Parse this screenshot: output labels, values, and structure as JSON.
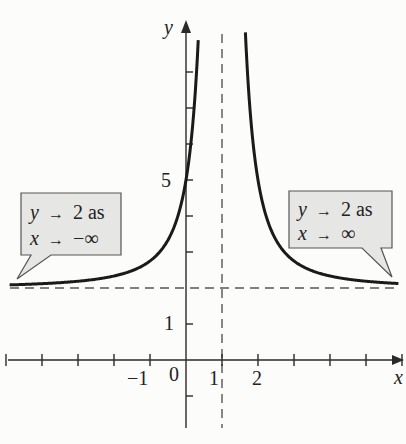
{
  "chart_data": {
    "type": "line",
    "title": "",
    "xlabel": "x",
    "ylabel": "y",
    "function": "y = 2 + 3/(x - 1)^2",
    "x_ticks": [
      -5,
      -4,
      -3,
      -2,
      -1,
      0,
      1,
      2,
      3,
      4,
      5,
      6
    ],
    "x_tick_labels": [
      {
        "value": -1,
        "label": "−1"
      },
      {
        "value": 0,
        "label": "0"
      },
      {
        "value": 1,
        "label": "1"
      },
      {
        "value": 2,
        "label": "2"
      }
    ],
    "y_ticks": [
      -1,
      1,
      2,
      3,
      4,
      5,
      6,
      7,
      8
    ],
    "y_tick_labels": [
      {
        "value": 1,
        "label": "1"
      },
      {
        "value": 5,
        "label": "5"
      }
    ],
    "xlim": [
      -5.1,
      6.1
    ],
    "ylim": [
      -1.9,
      9.3
    ],
    "grid": false,
    "asymptotes": {
      "vertical": {
        "x": 1,
        "style": "dashed"
      },
      "horizontal": {
        "y": 2,
        "style": "dashed"
      }
    },
    "series": [
      {
        "name": "left branch",
        "x": [
          -4.8,
          -4,
          -3,
          -2,
          -1,
          -0.5,
          0,
          0.2,
          0.33
        ],
        "y": [
          2.09,
          2.12,
          2.19,
          2.33,
          2.75,
          3.33,
          5.0,
          6.69,
          8.68
        ]
      },
      {
        "name": "right branch",
        "x": [
          1.64,
          1.8,
          2,
          2.5,
          3,
          4,
          5,
          5.9
        ],
        "y": [
          9.32,
          6.69,
          5.0,
          3.33,
          2.75,
          2.33,
          2.19,
          2.12
        ]
      }
    ],
    "annotations": [
      {
        "line1": "y → 2 as",
        "line2": "x → −∞",
        "points_to": "left tail"
      },
      {
        "line1": "y → 2 as",
        "line2": "x → ∞",
        "points_to": "right tail"
      }
    ]
  },
  "labels": {
    "x_axis": "x",
    "y_axis": "y",
    "tick_neg1": "−1",
    "tick_0": "0",
    "tick_1": "1",
    "tick_2": "2",
    "ytick_1": "1",
    "ytick_5": "5"
  },
  "callouts": {
    "left": {
      "y_part": "y",
      "arrow": "→",
      "value": "2 as",
      "x_part": "x",
      "limit": "−∞"
    },
    "right": {
      "y_part": "y",
      "arrow": "→",
      "value": "2 as",
      "x_part": "x",
      "limit": "∞"
    }
  },
  "colors": {
    "curve": "#1a1a1a",
    "axis": "#2a2a2a",
    "asymptote": "#555555",
    "callout_fill": "#e6e6e4",
    "callout_stroke": "#555555",
    "background": "#fcfcfa"
  }
}
